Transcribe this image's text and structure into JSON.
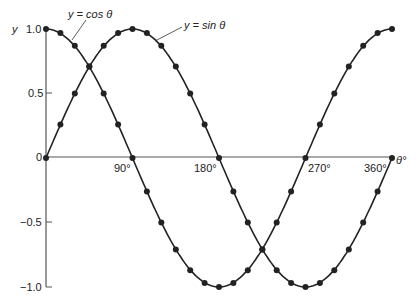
{
  "chart_data": {
    "type": "line",
    "title": "",
    "xlabel": "θ°",
    "ylabel": "y",
    "xlim": [
      0,
      360
    ],
    "ylim": [
      -1.0,
      1.0
    ],
    "grid": false,
    "x_ticks": [
      {
        "value": 90,
        "label": "90°"
      },
      {
        "value": 180,
        "label": "180°"
      },
      {
        "value": 270,
        "label": "270°"
      },
      {
        "value": 360,
        "label": "360°"
      }
    ],
    "y_ticks": [
      {
        "value": 1.0,
        "label": "1.0"
      },
      {
        "value": 0.5,
        "label": "0.5"
      },
      {
        "value": 0,
        "label": "0"
      },
      {
        "value": -0.5,
        "label": "-0.5"
      },
      {
        "value": -1.0,
        "label": "-1.0"
      }
    ],
    "x": [
      0,
      15,
      30,
      45,
      60,
      75,
      90,
      105,
      120,
      135,
      150,
      165,
      180,
      195,
      210,
      225,
      240,
      255,
      270,
      285,
      300,
      315,
      330,
      345,
      360
    ],
    "series": [
      {
        "name": "y = sin θ",
        "values": [
          0,
          0.26,
          0.5,
          0.71,
          0.87,
          0.97,
          1.0,
          0.97,
          0.87,
          0.71,
          0.5,
          0.26,
          0,
          -0.26,
          -0.5,
          -0.71,
          -0.87,
          -0.97,
          -1.0,
          -0.97,
          -0.87,
          -0.71,
          -0.5,
          -0.26,
          0
        ]
      },
      {
        "name": "y = cos θ",
        "values": [
          1.0,
          0.97,
          0.87,
          0.71,
          0.5,
          0.26,
          0,
          -0.26,
          -0.5,
          -0.71,
          -0.87,
          -0.97,
          -1.0,
          -0.97,
          -0.87,
          -0.71,
          -0.5,
          -0.26,
          0,
          0.26,
          0.5,
          0.71,
          0.87,
          0.97,
          1.0
        ]
      }
    ],
    "annotations": [
      {
        "text": "y = cos θ",
        "points_to": "cos curve near θ=50°"
      },
      {
        "text": "y = sin θ",
        "points_to": "sin curve near θ=110°"
      }
    ],
    "legend": "none (inline annotations)"
  },
  "labels": {
    "y_axis": "y",
    "x_axis": "θ°",
    "cos_label": "y = cos θ",
    "sin_label": "y = sin θ",
    "origin": "0",
    "tick_1": "1.0",
    "tick_05": "0.5",
    "tick_m05": "−0.5",
    "tick_m1": "−1.0",
    "tick_90": "90°",
    "tick_180": "180°",
    "tick_270": "270°",
    "tick_360": "360°"
  },
  "colors": {
    "line": "#222222",
    "axis": "#555555",
    "background": "#ffffff"
  }
}
